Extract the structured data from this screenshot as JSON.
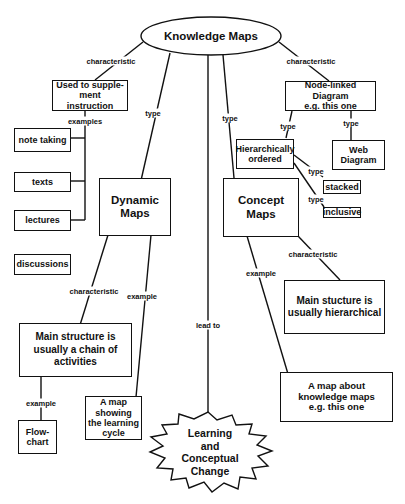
{
  "root": {
    "label": "Knowledge Maps"
  },
  "nodes": {
    "supplement": "Used to supple-\nment instruction",
    "note_taking": "note taking",
    "texts": "texts",
    "lectures": "lectures",
    "discussions": "discussions",
    "dynamic_maps": "Dynamic Maps",
    "concept_maps": "Concept Maps",
    "node_linked": "Node-linked Diagram\ne.g. this one",
    "hierarchically": "Hierarchically\nordered",
    "web_diagram": "Web Diagram",
    "stacked": "stacked",
    "inclusive": "inclusive",
    "dynamic_structure": "Main structure is\nusually a chain of\nactivities",
    "concept_structure": "Main stucture is\nusually hierarchical",
    "flowchart": "Flow-\nchart",
    "learning_cycle": "A map\nshowing\nthe learning\ncycle",
    "about_maps": "A map about\nknowledge maps\ne.g. this one",
    "learning_change": "Learning\nand\nConceptual\nChange"
  },
  "links": {
    "root_supplement": "characteristic",
    "root_nodelinked": "characteristic",
    "root_dynamic": "type",
    "root_concept": "type",
    "root_learning": "lead to",
    "supplement_examples": "examples",
    "nodelinked_hier": "type",
    "nodelinked_web": "type",
    "hier_stacked": "type",
    "hier_inclusive": "type",
    "dynamic_characteristic": "characteristic",
    "dynamic_example": "example",
    "concept_characteristic": "characteristic",
    "concept_example": "example",
    "structure_example": "example"
  }
}
